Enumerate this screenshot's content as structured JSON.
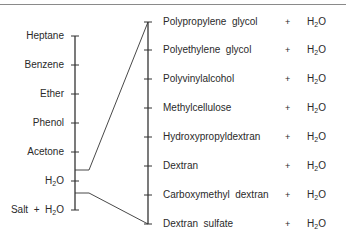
{
  "diagram": {
    "left_axis": {
      "items": [
        {
          "label": "Heptane",
          "y": 36
        },
        {
          "label": "Benzene",
          "y": 65
        },
        {
          "label": "Ether",
          "y": 94
        },
        {
          "label": "Phenol",
          "y": 123
        },
        {
          "label": "Acetone",
          "y": 152
        },
        {
          "label": "H",
          "sub": "2",
          "tail": "O",
          "y": 181
        },
        {
          "label": "Salt  +  H",
          "sub": "2",
          "tail": "O",
          "y": 210
        }
      ]
    },
    "right_axis": {
      "items": [
        {
          "label": "Polypropylene  glycol",
          "plus": "+",
          "solvent": "H",
          "sub": "2",
          "tail": "O",
          "y": 22
        },
        {
          "label": "Polyethylene  glycol",
          "plus": "+",
          "solvent": "H",
          "sub": "2",
          "tail": "O",
          "y": 50
        },
        {
          "label": "Polyvinylalcohol",
          "plus": "+",
          "solvent": "H",
          "sub": "2",
          "tail": "O",
          "y": 79
        },
        {
          "label": "Methylcellulose",
          "plus": "+",
          "solvent": "H",
          "sub": "2",
          "tail": "O",
          "y": 108
        },
        {
          "label": "Hydroxypropyldextran",
          "plus": "+",
          "solvent": "H",
          "sub": "2",
          "tail": "O",
          "y": 137
        },
        {
          "label": "Dextran",
          "plus": "+",
          "solvent": "H",
          "sub": "2",
          "tail": "O",
          "y": 166
        },
        {
          "label": "Carboxymethyl  dextran",
          "plus": "+",
          "solvent": "H",
          "sub": "2",
          "tail": "O",
          "y": 195
        },
        {
          "label": "Dextran  sulfate",
          "plus": "+",
          "solvent": "H",
          "sub": "2",
          "tail": "O",
          "y": 224
        }
      ]
    },
    "connectors": [
      {
        "from": "between Acetone and H2O",
        "to": "Polypropylene glycol"
      },
      {
        "from": "between H2O and Salt + H2O",
        "to": "Dextran sulfate"
      }
    ],
    "colors": {
      "line": "#333333",
      "text": "#2a2a2a",
      "rule": "#8a8a8a"
    }
  }
}
